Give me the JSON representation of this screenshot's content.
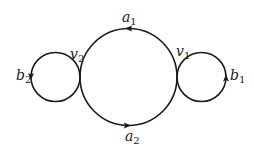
{
  "diagram": {
    "type": "graph",
    "colors": {
      "stroke": "#1a1a1a",
      "background": "#ffffff"
    },
    "vertices": [
      {
        "id": "v1",
        "base": "v",
        "sub": "1"
      },
      {
        "id": "v2",
        "base": "v",
        "sub": "2"
      }
    ],
    "edges": [
      {
        "id": "a1",
        "base": "a",
        "sub": "1",
        "from": "v1",
        "to": "v2",
        "position": "top arc of large circle",
        "direction": "right-to-left"
      },
      {
        "id": "a2",
        "base": "a",
        "sub": "2",
        "from": "v2",
        "to": "v1",
        "position": "bottom arc of large circle",
        "direction": "left-to-right"
      },
      {
        "id": "b1",
        "base": "b",
        "sub": "1",
        "from": "v1",
        "to": "v1",
        "position": "right loop",
        "direction": "counter-clockwise (upward on right side)"
      },
      {
        "id": "b2",
        "base": "b",
        "sub": "2",
        "from": "v2",
        "to": "v2",
        "position": "left loop",
        "direction": "counter-clockwise (downward on left side)"
      }
    ],
    "labels": {
      "a1": {
        "base": "a",
        "sub": "1"
      },
      "a2": {
        "base": "a",
        "sub": "2"
      },
      "b1": {
        "base": "b",
        "sub": "1"
      },
      "b2": {
        "base": "b",
        "sub": "2"
      },
      "v1": {
        "base": "v",
        "sub": "1"
      },
      "v2": {
        "base": "v",
        "sub": "2"
      }
    }
  }
}
